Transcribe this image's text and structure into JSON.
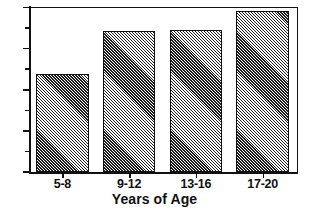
{
  "chart_data": {
    "type": "bar",
    "title": "",
    "subtitle": "",
    "xlabel": "Years of Age",
    "ylabel": "",
    "categories": [
      "5-8",
      "9-12",
      "13-16",
      "17-20"
    ],
    "values": [
      47.5,
      68.5,
      69,
      78
    ],
    "ylim": [
      0,
      80
    ],
    "y_ticks_major": [
      0,
      20,
      40,
      60,
      80
    ],
    "y_tick_labels": [
      "0",
      "20",
      "40",
      "60",
      "80"
    ],
    "y_ticks_minor": [
      10,
      30,
      50,
      70
    ],
    "grid": false,
    "legend": null,
    "bar_fill": "diagonal-hatch",
    "bar_edge_color": "#111111",
    "annotations": []
  },
  "colors": {
    "ink": "#111111",
    "paper": "#ffffff",
    "hatch": "#1b1b1b"
  }
}
